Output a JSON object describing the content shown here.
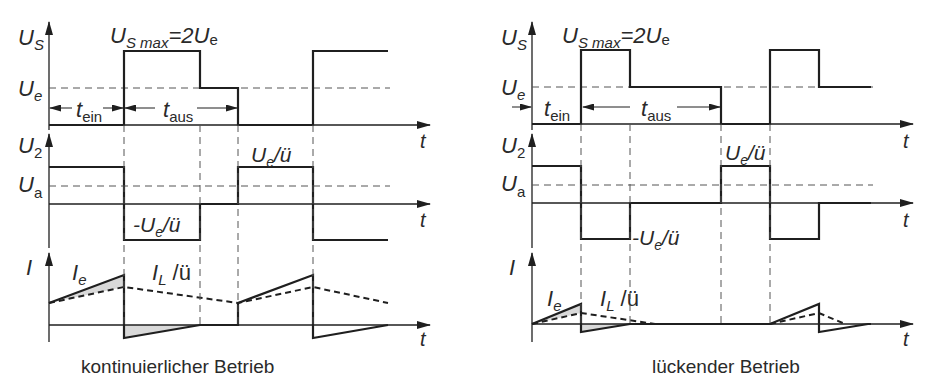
{
  "panels": [
    {
      "id": "continuous",
      "caption": "kontinuierlicher Betrieb",
      "x_axis": 49,
      "x_end": 430,
      "t_label": "t",
      "us": {
        "axis_label": "U",
        "axis_sub": "S",
        "max_label": "U",
        "max_sub": "S max",
        "max_eq": "=2U",
        "max_eq_sub": "e",
        "ue_label": "U",
        "ue_sub": "e",
        "baseline_y": 125,
        "ue_y": 88,
        "max_y": 51,
        "path": [
          [
            49,
            125
          ],
          [
            124,
            125
          ],
          [
            124,
            51
          ],
          [
            200,
            51
          ],
          [
            200,
            88
          ],
          [
            238,
            88
          ],
          [
            238,
            125
          ],
          [
            313,
            125
          ],
          [
            313,
            51
          ],
          [
            388,
            51
          ]
        ],
        "tein_label": "t",
        "tein_sub": "ein",
        "taus_label": "t",
        "taus_sub": "aus"
      },
      "u2": {
        "axis_label": "U",
        "axis_sub": "2",
        "ua_label": "U",
        "ua_sub": "a",
        "zero_y": 204,
        "ua_y": 186,
        "top_y": 167,
        "bot_y": 240,
        "path": [
          [
            49,
            167
          ],
          [
            124,
            167
          ],
          [
            124,
            240
          ],
          [
            200,
            240
          ],
          [
            200,
            204
          ],
          [
            238,
            204
          ],
          [
            238,
            167
          ],
          [
            313,
            167
          ],
          [
            313,
            240
          ],
          [
            388,
            240
          ]
        ],
        "pos_label": "U",
        "pos_sub": "e",
        "pos_tail": "/ü",
        "neg_label": "-U",
        "neg_sub": "e",
        "neg_tail": "/ü"
      },
      "current": {
        "axis_label": "I",
        "ie_label": "I",
        "ie_sub": "e",
        "il_label": "I",
        "il_sub": "L",
        "il_tail": " /ü",
        "zero_y": 325,
        "ie_path": [
          [
            49,
            303
          ],
          [
            124,
            275
          ],
          [
            124,
            338
          ],
          [
            200,
            325
          ],
          [
            238,
            325
          ],
          [
            238,
            303
          ],
          [
            313,
            275
          ],
          [
            313,
            338
          ],
          [
            388,
            325
          ]
        ],
        "il_path": [
          [
            49,
            303
          ],
          [
            124,
            287
          ],
          [
            238,
            303
          ],
          [
            313,
            287
          ],
          [
            388,
            303
          ]
        ],
        "shade_pos": [
          [
            49,
            303
          ],
          [
            124,
            275
          ],
          [
            124,
            287
          ]
        ],
        "shade_neg": [
          [
            124,
            325
          ],
          [
            124,
            338
          ],
          [
            200,
            325
          ]
        ]
      },
      "vlines": [
        124,
        200,
        238,
        313
      ]
    },
    {
      "id": "discontinuous",
      "caption": "lückender Betrieb",
      "x_axis": 532,
      "x_end": 913,
      "t_label": "t",
      "us": {
        "axis_label": "U",
        "axis_sub": "S",
        "max_label": "U",
        "max_sub": "S max",
        "max_eq": "=2U",
        "max_eq_sub": "e",
        "ue_label": "U",
        "ue_sub": "e",
        "baseline_y": 124,
        "ue_y": 87,
        "max_y": 50,
        "path": [
          [
            532,
            124
          ],
          [
            581,
            124
          ],
          [
            581,
            50
          ],
          [
            630,
            50
          ],
          [
            630,
            87
          ],
          [
            721,
            87
          ],
          [
            721,
            124
          ],
          [
            770,
            124
          ],
          [
            770,
            50
          ],
          [
            819,
            50
          ],
          [
            819,
            87
          ],
          [
            871,
            87
          ]
        ],
        "tein_label": "t",
        "tein_sub": "ein",
        "taus_label": "t",
        "taus_sub": "aus"
      },
      "u2": {
        "axis_label": "U",
        "axis_sub": "2",
        "ua_label": "U",
        "ua_sub": "a",
        "zero_y": 203,
        "ua_y": 185,
        "top_y": 166,
        "bot_y": 239,
        "path": [
          [
            532,
            166
          ],
          [
            581,
            166
          ],
          [
            581,
            239
          ],
          [
            630,
            239
          ],
          [
            630,
            203
          ],
          [
            721,
            203
          ],
          [
            721,
            166
          ],
          [
            770,
            166
          ],
          [
            770,
            239
          ],
          [
            819,
            239
          ],
          [
            819,
            203
          ],
          [
            871,
            203
          ]
        ],
        "pos_label": "U",
        "pos_sub": "e",
        "pos_tail": "/ü",
        "neg_label": "-U",
        "neg_sub": "e",
        "neg_tail": "/ü"
      },
      "current": {
        "axis_label": "I",
        "ie_label": "I",
        "ie_sub": "e",
        "il_label": "I",
        "il_sub": "L",
        "il_tail": " /ü",
        "zero_y": 324,
        "ie_path": [
          [
            532,
            324
          ],
          [
            581,
            304
          ],
          [
            581,
            332
          ],
          [
            630,
            324
          ],
          [
            770,
            324
          ],
          [
            819,
            304
          ],
          [
            819,
            332
          ],
          [
            868,
            324
          ],
          [
            871,
            324
          ]
        ],
        "il_path": [
          [
            532,
            324
          ],
          [
            581,
            313
          ],
          [
            655,
            324
          ],
          [
            770,
            324
          ],
          [
            819,
            313
          ],
          [
            845,
            324
          ]
        ],
        "shade_pos": [
          [
            532,
            324
          ],
          [
            581,
            304
          ],
          [
            581,
            313
          ]
        ],
        "shade_neg": [
          [
            581,
            324
          ],
          [
            581,
            332
          ],
          [
            630,
            324
          ]
        ]
      },
      "vlines": [
        581,
        630,
        721,
        770
      ]
    }
  ],
  "colors": {
    "ink": "#1f1f1f",
    "dash": "#555555",
    "shade": "#d9d9d9"
  }
}
